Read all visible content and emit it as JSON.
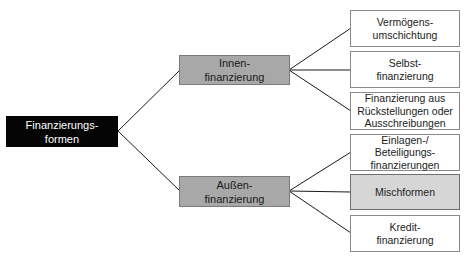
{
  "diagram": {
    "type": "tree",
    "orientation": "left-to-right",
    "root": {
      "label": "Finanzierungs-\nformen",
      "fill": "#050505",
      "text_color": "#ffffff"
    },
    "branches": [
      {
        "label": "Innen-\nfinanzierung",
        "fill": "#a8a8a8",
        "children": [
          {
            "label": "Vermögens-\numschichtung",
            "fill": "#ffffff"
          },
          {
            "label": "Selbst-\nfinanzierung",
            "fill": "#ffffff"
          },
          {
            "label": "Finanzierung aus\nRückstellungen oder\nAusschreibungen",
            "fill": "#ffffff"
          }
        ]
      },
      {
        "label": "Außen-\nfinanzierung",
        "fill": "#a8a8a8",
        "children": [
          {
            "label": "Einlagen-/\nBeteiligungs-\nfinanzierungen",
            "fill": "#ffffff"
          },
          {
            "label": "Mischformen",
            "fill": "#d6d6d6"
          },
          {
            "label": "Kredit-\nfinanzierung",
            "fill": "#ffffff"
          }
        ]
      }
    ],
    "colors": {
      "line": "#1a1a1a",
      "leaf_border": "#8a8a8a"
    }
  }
}
